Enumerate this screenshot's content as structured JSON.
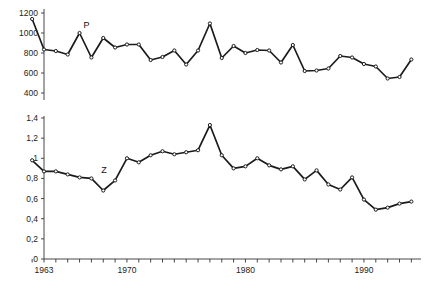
{
  "chart_data": [
    {
      "type": "line",
      "id": "panel-p",
      "title": "",
      "series_label": "P",
      "xlabel": "",
      "ylabel": "",
      "x": [
        1962,
        1963,
        1964,
        1965,
        1966,
        1967,
        1968,
        1969,
        1970,
        1971,
        1972,
        1973,
        1974,
        1975,
        1976,
        1977,
        1978,
        1979,
        1980,
        1981,
        1982,
        1983,
        1984,
        1985,
        1986,
        1987,
        1988,
        1989,
        1990,
        1991,
        1992,
        1993,
        1994
      ],
      "values": [
        1140,
        835,
        820,
        785,
        1000,
        755,
        950,
        855,
        885,
        885,
        730,
        760,
        825,
        685,
        825,
        1095,
        750,
        870,
        800,
        830,
        825,
        705,
        880,
        620,
        625,
        645,
        770,
        755,
        690,
        665,
        545,
        560,
        735,
        590,
        370,
        415
      ],
      "ylim": [
        300,
        1250
      ],
      "yticks": [
        400,
        600,
        800,
        1000,
        1200
      ],
      "ytick_labels": [
        "400",
        "600",
        "800",
        "1000",
        "1200"
      ],
      "xticks": [
        1963,
        1970,
        1980,
        1990
      ],
      "xtick_labels": [
        "1963",
        "1970",
        "1980",
        "1990"
      ],
      "grid": false,
      "marker": "open-circle"
    },
    {
      "type": "line",
      "id": "panel-z",
      "title": "",
      "series_label": "Z",
      "xlabel": "",
      "ylabel": "",
      "x": [
        1962,
        1963,
        1964,
        1965,
        1966,
        1967,
        1968,
        1969,
        1970,
        1971,
        1972,
        1973,
        1974,
        1975,
        1976,
        1977,
        1978,
        1979,
        1980,
        1981,
        1982,
        1983,
        1984,
        1985,
        1986,
        1987,
        1988,
        1989,
        1990,
        1991,
        1992,
        1993,
        1994
      ],
      "values": [
        0.98,
        0.87,
        0.87,
        0.84,
        0.81,
        0.8,
        0.68,
        0.78,
        1.0,
        0.96,
        1.03,
        1.07,
        1.04,
        1.06,
        1.08,
        1.33,
        1.03,
        0.9,
        0.92,
        1.0,
        0.93,
        0.89,
        0.92,
        0.79,
        0.88,
        0.74,
        0.69,
        0.81,
        0.59,
        0.49,
        0.51,
        0.55,
        0.57,
        0.54,
        0.55,
        0.6
      ],
      "ylim": [
        0,
        1.4
      ],
      "yticks": [
        0,
        0.2,
        0.4,
        0.6,
        0.8,
        1.0,
        1.2,
        1.4
      ],
      "ytick_labels": [
        "0",
        "0,2",
        "0,4",
        "0,6",
        "0,8",
        "1",
        "1,2",
        "1,4"
      ],
      "xticks": [
        1963,
        1970,
        1980,
        1990
      ],
      "xtick_labels": [
        "1963",
        "1970",
        "1980",
        "1990"
      ],
      "grid": false,
      "marker": "open-circle"
    }
  ],
  "colors": {
    "line": "#1b1b1b",
    "axis": "#333333",
    "marker_fill": "#ffffff",
    "background": "#ffffff",
    "text": "#222222"
  },
  "axis": {
    "x_start_year": 1962,
    "x_end_year": 1994,
    "x_tick_labels": [
      "1963",
      "1970",
      "1980",
      "1990"
    ]
  }
}
